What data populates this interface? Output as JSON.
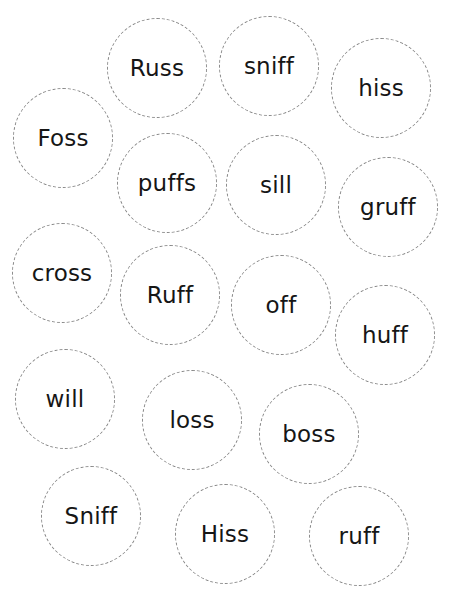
{
  "worksheet": {
    "bubble_border_color": "#8a8a8a",
    "text_color": "#161616",
    "words": [
      {
        "text": "Russ",
        "cx": 158,
        "cy": 69
      },
      {
        "text": "sniff",
        "cx": 270,
        "cy": 67
      },
      {
        "text": "hiss",
        "cx": 382,
        "cy": 89
      },
      {
        "text": "Foss",
        "cx": 64,
        "cy": 139
      },
      {
        "text": "puffs",
        "cx": 168,
        "cy": 184
      },
      {
        "text": "sill",
        "cx": 277,
        "cy": 186
      },
      {
        "text": "gruff",
        "cx": 389,
        "cy": 208
      },
      {
        "text": "cross",
        "cx": 63,
        "cy": 274
      },
      {
        "text": "Ruff",
        "cx": 171,
        "cy": 296
      },
      {
        "text": "off",
        "cx": 282,
        "cy": 306
      },
      {
        "text": "huff",
        "cx": 386,
        "cy": 336
      },
      {
        "text": "will",
        "cx": 66,
        "cy": 400
      },
      {
        "text": "loss",
        "cx": 193,
        "cy": 421
      },
      {
        "text": "boss",
        "cx": 310,
        "cy": 435
      },
      {
        "text": "Sniff",
        "cx": 92,
        "cy": 517
      },
      {
        "text": "Hiss",
        "cx": 226,
        "cy": 535
      },
      {
        "text": "ruff",
        "cx": 360,
        "cy": 537
      }
    ]
  }
}
